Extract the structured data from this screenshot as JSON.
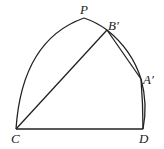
{
  "figure": {
    "type": "geometry-diagram",
    "labels": {
      "P": "P",
      "B": "B′",
      "A": "A′",
      "C": "C",
      "D": "D"
    },
    "points": {
      "P": [
        84,
        18
      ],
      "B": [
        107,
        30
      ],
      "A": [
        141,
        79
      ],
      "C": [
        16,
        129
      ],
      "D": [
        143,
        129
      ]
    },
    "segments": [
      [
        "C",
        "D"
      ],
      [
        "C",
        "B"
      ],
      [
        "B",
        "A"
      ]
    ],
    "arcs": [
      [
        "C",
        "P"
      ],
      [
        "P",
        "B"
      ],
      [
        "B",
        "A"
      ],
      [
        "A",
        "D"
      ],
      [
        "A",
        "D",
        "inner"
      ]
    ],
    "stroke_color": "#222222"
  }
}
